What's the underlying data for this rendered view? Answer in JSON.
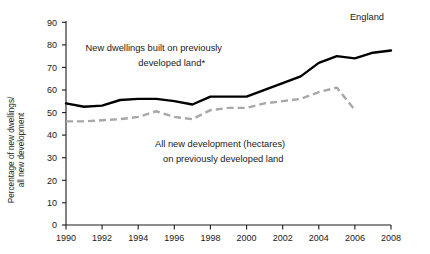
{
  "chart_data": {
    "type": "line",
    "title": "",
    "region_label": "England",
    "xlabel": "",
    "ylabel": "Percentage of new dwellings/ all new development",
    "ylabel_lines": [
      "Percentage of new dwellings/",
      "all new development"
    ],
    "xlim": [
      1990,
      2008
    ],
    "ylim": [
      0,
      90
    ],
    "grid": false,
    "legend_position": "inline-annotations",
    "y_ticks": [
      0,
      10,
      20,
      30,
      40,
      50,
      60,
      70,
      80,
      90
    ],
    "x_ticks": [
      1990,
      1992,
      1994,
      1996,
      1998,
      2000,
      2002,
      2004,
      2006,
      2008
    ],
    "x": [
      1990,
      1991,
      1992,
      1993,
      1994,
      1995,
      1996,
      1997,
      1998,
      1999,
      2000,
      2001,
      2002,
      2003,
      2004,
      2005,
      2006,
      2007,
      2008
    ],
    "series": [
      {
        "name": "New dwellings built on previously developed land*",
        "style": "solid",
        "color": "#000000",
        "annotation_lines": [
          "New dwellings built on previously",
          "developed land*"
        ],
        "x": [
          1990,
          1991,
          1992,
          1993,
          1994,
          1995,
          1996,
          1997,
          1998,
          1999,
          2000,
          2001,
          2002,
          2003,
          2004,
          2005,
          2006,
          2007,
          2008
        ],
        "values": [
          54,
          52.5,
          53,
          55.5,
          56,
          56,
          55,
          53.5,
          57,
          57,
          57,
          60,
          63,
          66,
          72,
          75,
          74,
          76.5,
          77.5
        ]
      },
      {
        "name": "All new development (hectares) on previously developed land",
        "style": "dashed",
        "color": "#a8a8a8",
        "annotation_lines": [
          "All new development (hectares)",
          "on previously developed land"
        ],
        "x": [
          1990,
          1991,
          1992,
          1993,
          1994,
          1995,
          1996,
          1997,
          1998,
          1999,
          2000,
          2001,
          2002,
          2003,
          2004,
          2005,
          2006
        ],
        "values": [
          46,
          46,
          46.5,
          47,
          48,
          50.5,
          48,
          47,
          51,
          52,
          52,
          54,
          55,
          56,
          59,
          61,
          51
        ]
      }
    ]
  },
  "axis": {
    "y_tick_labels": [
      "0",
      "10",
      "20",
      "30",
      "40",
      "50",
      "60",
      "70",
      "80",
      "90"
    ],
    "x_tick_labels": [
      "1990",
      "1992",
      "1994",
      "1996",
      "1998",
      "2000",
      "2002",
      "2004",
      "2006",
      "2008"
    ],
    "y_title_line1": "Percentage of new dwellings/",
    "y_title_line2": "all new development"
  },
  "annotations": {
    "region": "England",
    "solid_line1": "New dwellings built on previously",
    "solid_line2": "developed land*",
    "dashed_line1": "All new development (hectares)",
    "dashed_line2": "on previously developed land"
  },
  "colors": {
    "solid_series": "#000000",
    "dashed_series": "#a8a8a8",
    "axis": "#1a1a1a",
    "background": "#ffffff"
  }
}
